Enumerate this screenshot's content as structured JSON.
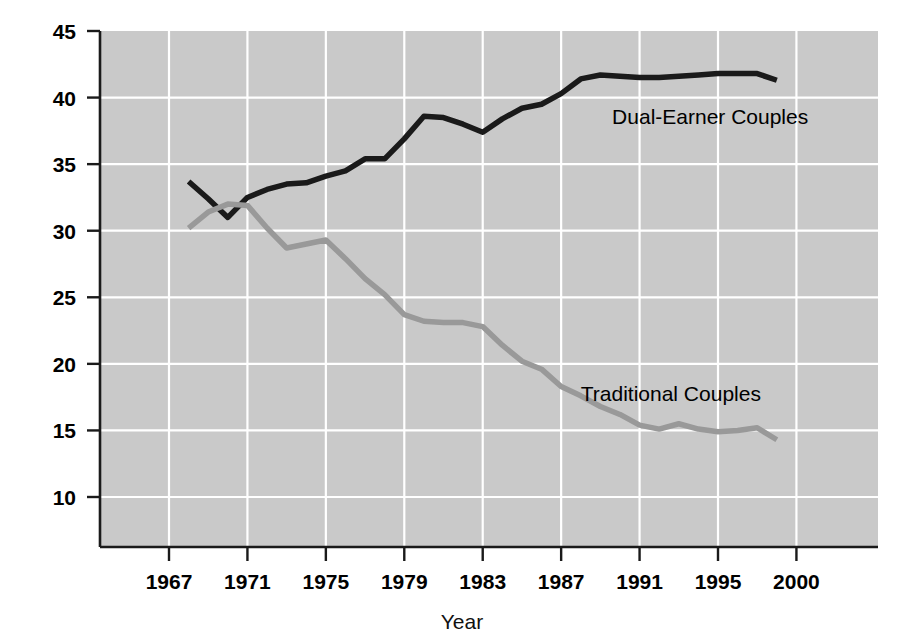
{
  "chart_data": {
    "type": "line",
    "title": "",
    "xlabel": "Year",
    "ylabel": "",
    "xlim": [
      1965,
      2000
    ],
    "ylim": [
      7.5,
      45
    ],
    "grid": true,
    "legend_position": "inline-annotations",
    "xtick_labels": [
      "1967",
      "1971",
      "1975",
      "1979",
      "1983",
      "1987",
      "1991",
      "1995",
      "2000"
    ],
    "ytick_labels": [
      "45",
      "40",
      "35",
      "30",
      "25",
      "20",
      "15",
      "10"
    ],
    "xticks": [
      1967,
      1971,
      1975,
      1979,
      1983,
      1987,
      1991,
      1995,
      1999
    ],
    "yticks": [
      45,
      40,
      35,
      30,
      25,
      20,
      15,
      10
    ],
    "series": [
      {
        "name": "Dual-Earner Couples",
        "color": "#1a1a1a",
        "stroke_width": 5.5,
        "label_x": 1989.6,
        "label_y": 38.0,
        "x": [
          1968,
          1969,
          1970,
          1971,
          1972,
          1973,
          1974,
          1975,
          1976,
          1977,
          1978,
          1979,
          1980,
          1981,
          1982,
          1983,
          1984,
          1985,
          1986,
          1987,
          1988,
          1989,
          1990,
          1991,
          1992,
          1993,
          1994,
          1995,
          1996,
          1997,
          1998
        ],
        "values": [
          33.7,
          32.4,
          31.0,
          32.5,
          33.1,
          33.5,
          33.6,
          34.1,
          34.5,
          35.4,
          35.4,
          36.9,
          38.6,
          38.5,
          38.0,
          37.4,
          38.4,
          39.2,
          39.5,
          40.3,
          41.4,
          41.7,
          41.6,
          41.5,
          41.5,
          41.6,
          41.7,
          41.8,
          41.8,
          41.8,
          41.3
        ]
      },
      {
        "name": "Traditional Couples",
        "color": "#999999",
        "stroke_width": 5.5,
        "label_x": 1988.0,
        "label_y": 17.2,
        "x": [
          1968,
          1969,
          1970,
          1971,
          1972,
          1973,
          1974,
          1975,
          1976,
          1977,
          1978,
          1979,
          1980,
          1981,
          1982,
          1983,
          1984,
          1985,
          1986,
          1987,
          1988,
          1989,
          1990,
          1991,
          1992,
          1993,
          1994,
          1995,
          1996,
          1997,
          1998
        ],
        "values": [
          30.2,
          31.4,
          32.0,
          31.9,
          30.2,
          28.7,
          29.0,
          29.3,
          27.9,
          26.4,
          25.2,
          23.7,
          23.2,
          23.1,
          23.1,
          22.8,
          21.4,
          20.2,
          19.6,
          18.3,
          17.6,
          16.8,
          16.2,
          15.4,
          15.1,
          15.5,
          15.1,
          14.9,
          15.0,
          15.2,
          14.3
        ]
      }
    ]
  },
  "axes": {
    "x_title": "Year"
  },
  "colors": {
    "plot_background": "#c9c9c9",
    "gridline": "#ffffff",
    "axis": "#1a1a1a",
    "page_background": "#ffffff"
  }
}
